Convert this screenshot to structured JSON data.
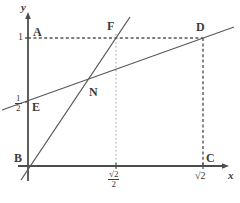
{
  "figure": {
    "background": "#ffffff",
    "stroke_color": "#555555",
    "dash_color": "#6a6a6a",
    "text_color": "#3c3c3c",
    "width": 240,
    "height": 203
  },
  "axes": {
    "x_label": "x",
    "y_label": "y",
    "origin": {
      "x": 28,
      "y": 166
    },
    "x_axis": {
      "x1": 24,
      "y1": 166,
      "x2": 228,
      "y2": 166
    },
    "y_axis": {
      "x1": 28,
      "y1": 14,
      "x2": 28,
      "y2": 180
    }
  },
  "ticks": {
    "y": [
      {
        "label": "1",
        "value": 1,
        "px_y": 38
      },
      {
        "label_num": "1",
        "label_den": "2",
        "value": 0.5,
        "px_y": 102
      }
    ],
    "x": [
      {
        "label_num": "√2",
        "label_den": "2",
        "value": 0.7071,
        "px_x": 116
      },
      {
        "label": "√2",
        "value": 1.4142,
        "px_x": 203
      }
    ]
  },
  "points": [
    {
      "name": "A",
      "label": "A",
      "px_x": 28,
      "px_y": 38,
      "label_x": 33,
      "label_y": 26
    },
    {
      "name": "B",
      "label": "B",
      "px_x": 28,
      "px_y": 166,
      "label_x": 14,
      "label_y": 154
    },
    {
      "name": "C",
      "label": "C",
      "px_x": 203,
      "px_y": 166,
      "label_x": 206,
      "label_y": 154
    },
    {
      "name": "D",
      "label": "D",
      "px_x": 203,
      "px_y": 38,
      "label_x": 196,
      "label_y": 20
    },
    {
      "name": "E",
      "label": "E",
      "px_x": 28,
      "px_y": 102,
      "label_x": 32,
      "label_y": 104
    },
    {
      "name": "F",
      "label": "F",
      "px_x": 116,
      "px_y": 38,
      "label_x": 108,
      "label_y": 20
    },
    {
      "name": "N",
      "label": "N",
      "px_x": 85,
      "px_y": 83,
      "label_x": 90,
      "label_y": 87
    }
  ],
  "segments": {
    "line_BF": {
      "from": "B",
      "to": "F",
      "description": "solid line from origin B through N up through F and beyond"
    },
    "line_ED": {
      "from": "E",
      "to": "D",
      "description": "solid line from E on y-axis at 1/2 through N to D and beyond"
    },
    "dashed_AD": {
      "from": "A",
      "to": "D",
      "description": "horizontal dashed line at y = 1"
    },
    "dashed_CD": {
      "from": "C",
      "to": "D",
      "description": "vertical dashed line at x = sqrt(2)"
    },
    "dotted_F": {
      "description": "faint vertical dotted line at x = sqrt(2)/2 from F down to x-axis"
    }
  }
}
